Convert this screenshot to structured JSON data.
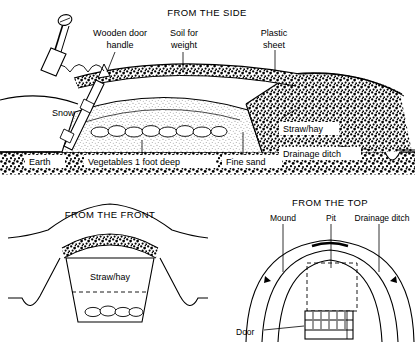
{
  "figure": {
    "type": "technical-line-diagram",
    "style": "black and white ink line drawing with stipple shading"
  },
  "panels": {
    "side": {
      "title": "FROM THE SIDE",
      "labels": {
        "handle": "Wooden door\nhandle",
        "handle_line1": "Wooden door",
        "handle_line2": "handle",
        "soil": "Soil for\nweight",
        "soil_line1": "Soil for",
        "soil_line2": "weight",
        "plastic": "Plastic\nsheet",
        "plastic_line1": "Plastic",
        "plastic_line2": "sheet",
        "snow": "Snow",
        "straw": "Straw/hay",
        "ditch": "Drainage ditch",
        "earth": "Earth",
        "vegetables": "Vegetables 1 foot deep",
        "sand": "Fine sand"
      }
    },
    "front": {
      "title": "FROM THE FRONT",
      "labels": {
        "straw": "Straw/hay"
      }
    },
    "top": {
      "title": "FROM THE TOP",
      "labels": {
        "mound": "Mound",
        "pit": "Pit",
        "ditch": "Drainage ditch",
        "door": "Door"
      }
    }
  },
  "colors": {
    "ink": "#000000",
    "paper": "#ffffff",
    "stipple": "#1a1a1a"
  }
}
